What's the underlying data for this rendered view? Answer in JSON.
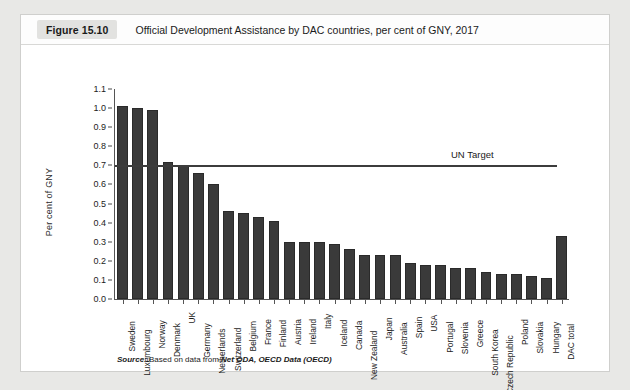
{
  "header": {
    "badge": "Figure 15.10",
    "title": "Official Development Assistance by DAC countries, per cent of GNY, 2017"
  },
  "source": {
    "keyword": "Source:",
    "text": " Based on data from ",
    "citation": "Net ODA, OECD Data (OECD)"
  },
  "annotation": {
    "un_target_label": "UN Target",
    "un_target_value": 0.7
  },
  "colors": {
    "bar_fill": "#3a3a3a",
    "bar_stroke": "#2a2a2a",
    "axis": "#555555",
    "target_line": "#3c3c3c",
    "card_bg": "#ffffff",
    "page_bg": "#e8e8e6",
    "badge_bg": "#e2e2e0"
  },
  "chart_data": {
    "type": "bar",
    "title": "Official Development Assistance by DAC countries, per cent of GNY, 2017",
    "xlabel": "",
    "ylabel": "Per cent of GNY",
    "ylim": [
      0.0,
      1.1
    ],
    "ytick_step": 0.1,
    "yticks": [
      "0.0",
      "0.1",
      "0.2",
      "0.3",
      "0.4",
      "0.5",
      "0.6",
      "0.7",
      "0.8",
      "0.9",
      "1.0",
      "1.1"
    ],
    "grid": false,
    "legend": false,
    "reference_lines": [
      {
        "label": "UN Target",
        "value": 0.7,
        "orientation": "horizontal"
      }
    ],
    "categories": [
      "Sweden",
      "Luxembourg",
      "Norway",
      "Denmark",
      "UK",
      "Germany",
      "Netherlands",
      "Switzerland",
      "Belgium",
      "France",
      "Finland",
      "Austria",
      "Ireland",
      "Italy",
      "Iceland",
      "Canada",
      "New Zealand",
      "Japan",
      "Australia",
      "Spain",
      "USA",
      "Portugal",
      "Slovenia",
      "Greece",
      "South Korea",
      "Czech Republic",
      "Poland",
      "Slovakia",
      "Hungary",
      "DAC total"
    ],
    "values": [
      1.01,
      1.0,
      0.99,
      0.72,
      0.7,
      0.66,
      0.6,
      0.46,
      0.45,
      0.43,
      0.41,
      0.3,
      0.3,
      0.3,
      0.29,
      0.26,
      0.23,
      0.23,
      0.23,
      0.19,
      0.18,
      0.18,
      0.16,
      0.16,
      0.14,
      0.13,
      0.13,
      0.12,
      0.11,
      0.33
    ]
  }
}
